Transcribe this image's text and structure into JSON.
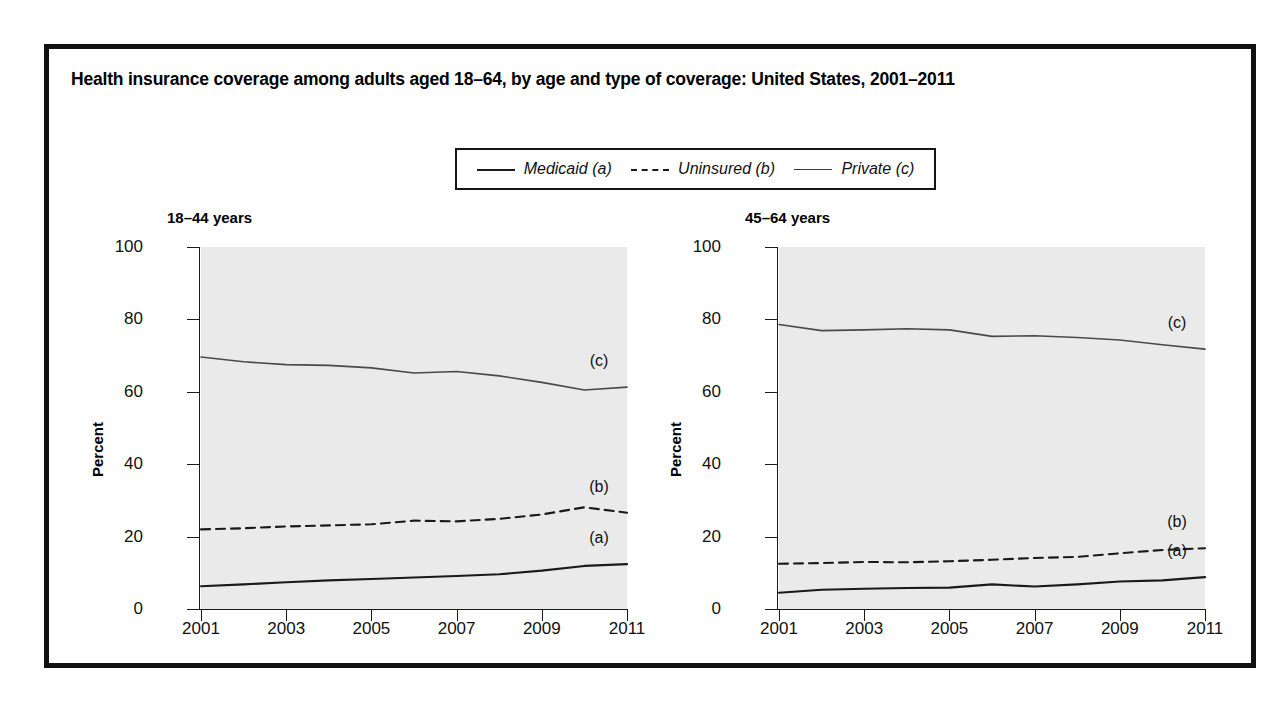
{
  "figure": {
    "title": "Health insurance coverage among adults aged 18–64, by age and type of coverage: United States, 2001–2011",
    "border_color": "#111111",
    "plot_background": "#eaeaea"
  },
  "legend": {
    "entries": [
      {
        "label": "Medicaid (a)",
        "style": "solid",
        "icon": "solid-line-icon"
      },
      {
        "label": "Uninsured (b)",
        "style": "dashed",
        "icon": "dashed-line-icon"
      },
      {
        "label": "Private (c)",
        "style": "thin-solid",
        "icon": "thin-line-icon"
      }
    ]
  },
  "chart_data": [
    {
      "type": "line",
      "title": "18–44 years",
      "xlabel": "",
      "ylabel": "Percent",
      "xlim": [
        2001,
        2011
      ],
      "ylim": [
        0,
        100
      ],
      "yticks": [
        0,
        20,
        40,
        60,
        80,
        100
      ],
      "xticks": [
        2001,
        2003,
        2005,
        2007,
        2009,
        2011
      ],
      "xtick_labels": [
        "2001",
        "2003",
        "2005",
        "2007",
        "2009",
        "2011"
      ],
      "ytick_labels": [
        "0",
        "20",
        "40",
        "60",
        "80",
        "100"
      ],
      "grid": false,
      "legend_position": "above-figure",
      "x": [
        2001,
        2002,
        2003,
        2004,
        2005,
        2006,
        2007,
        2008,
        2009,
        2010,
        2011
      ],
      "series": [
        {
          "name": "Medicaid (a)",
          "style": "solid",
          "annotation": "(a)",
          "values": [
            6.3,
            6.8,
            7.4,
            7.9,
            8.3,
            8.7,
            9.1,
            9.6,
            10.6,
            11.9,
            12.4
          ]
        },
        {
          "name": "Uninsured (b)",
          "style": "dashed",
          "annotation": "(b)",
          "values": [
            22.0,
            22.3,
            22.8,
            23.1,
            23.4,
            24.4,
            24.2,
            24.9,
            26.1,
            28.1,
            26.6
          ]
        },
        {
          "name": "Private (c)",
          "style": "thin-solid",
          "annotation": "(c)",
          "values": [
            69.6,
            68.3,
            67.5,
            67.3,
            66.6,
            65.2,
            65.6,
            64.4,
            62.6,
            60.5,
            61.3
          ]
        }
      ]
    },
    {
      "type": "line",
      "title": "45–64 years",
      "xlabel": "",
      "ylabel": "Percent",
      "xlim": [
        2001,
        2011
      ],
      "ylim": [
        0,
        100
      ],
      "yticks": [
        0,
        20,
        40,
        60,
        80,
        100
      ],
      "xticks": [
        2001,
        2003,
        2005,
        2007,
        2009,
        2011
      ],
      "xtick_labels": [
        "2001",
        "2003",
        "2005",
        "2007",
        "2009",
        "2011"
      ],
      "ytick_labels": [
        "0",
        "20",
        "40",
        "60",
        "80",
        "100"
      ],
      "grid": false,
      "legend_position": "above-figure",
      "x": [
        2001,
        2002,
        2003,
        2004,
        2005,
        2006,
        2007,
        2008,
        2009,
        2010,
        2011
      ],
      "series": [
        {
          "name": "Medicaid (a)",
          "style": "solid",
          "annotation": "(a)",
          "values": [
            4.5,
            5.3,
            5.6,
            5.8,
            5.9,
            6.8,
            6.2,
            6.8,
            7.6,
            7.9,
            8.8
          ]
        },
        {
          "name": "Uninsured (b)",
          "style": "dashed",
          "annotation": "(b)",
          "values": [
            12.5,
            12.7,
            13.0,
            12.9,
            13.2,
            13.6,
            14.1,
            14.4,
            15.4,
            16.3,
            16.8
          ]
        },
        {
          "name": "Private (c)",
          "style": "thin-solid",
          "annotation": "(c)",
          "values": [
            78.6,
            76.9,
            77.1,
            77.4,
            77.1,
            75.3,
            75.5,
            75.0,
            74.3,
            73.0,
            71.8
          ]
        }
      ]
    }
  ]
}
